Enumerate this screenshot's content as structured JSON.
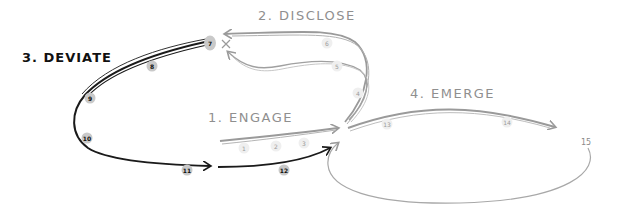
{
  "diagram": {
    "type": "hand-drawn process flow",
    "colors": {
      "grey_stroke": "#9a9a9a",
      "black_stroke": "#1a1a1a",
      "background": "#ffffff"
    },
    "stages": [
      {
        "id": "engage",
        "label": "1. ENGAGE",
        "color": "grey"
      },
      {
        "id": "disclose",
        "label": "2. DISCLOSE",
        "color": "grey"
      },
      {
        "id": "deviate",
        "label": "3. DEVIATE",
        "color": "black"
      },
      {
        "id": "emerge",
        "label": "4. EMERGE",
        "color": "grey"
      }
    ],
    "nodes": [
      {
        "n": "1",
        "stage": "engage"
      },
      {
        "n": "2",
        "stage": "engage"
      },
      {
        "n": "3",
        "stage": "engage"
      },
      {
        "n": "4",
        "stage": "disclose"
      },
      {
        "n": "5",
        "stage": "disclose"
      },
      {
        "n": "6",
        "stage": "disclose"
      },
      {
        "n": "7",
        "stage": "deviate"
      },
      {
        "n": "8",
        "stage": "deviate"
      },
      {
        "n": "9",
        "stage": "deviate"
      },
      {
        "n": "10",
        "stage": "deviate"
      },
      {
        "n": "11",
        "stage": "deviate"
      },
      {
        "n": "12",
        "stage": "deviate"
      },
      {
        "n": "13",
        "stage": "emerge"
      },
      {
        "n": "14",
        "stage": "emerge"
      },
      {
        "n": "15",
        "stage": "emerge"
      }
    ]
  }
}
